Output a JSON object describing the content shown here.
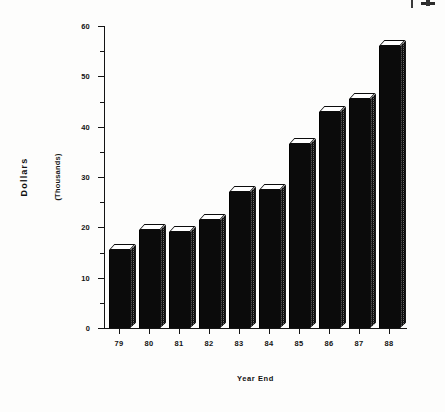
{
  "chart_data": {
    "type": "bar",
    "title": "",
    "subtitle": "",
    "xlabel": "Year End",
    "ylabel": "Dollars",
    "ylabel_units": "(Thousands)",
    "categories": [
      "79",
      "80",
      "81",
      "82",
      "83",
      "84",
      "85",
      "86",
      "87",
      "88"
    ],
    "values": [
      15.5,
      19.5,
      19.0,
      21.5,
      27.0,
      27.5,
      36.5,
      43.0,
      45.5,
      56.0
    ],
    "ylim": [
      0,
      60
    ],
    "y_major_ticks": [
      0,
      10,
      20,
      30,
      40,
      50,
      60
    ],
    "y_major_tick_labels": [
      "0",
      "10",
      "20",
      "30",
      "40",
      "50",
      "60"
    ],
    "y_minor_ticks": [
      5,
      15,
      25,
      35,
      45,
      55
    ],
    "grid": false,
    "legend": false,
    "legend_position": "none",
    "bar_style": "3d-block",
    "colors": {
      "bar_front": "#0b0b0b",
      "bar_top": "#ffffff",
      "bar_side": "#7d7d7d",
      "axis": "#141414",
      "text": "#111111",
      "background": "#fdfdfc"
    }
  },
  "axes": {
    "y_title": "Dollars",
    "y_units": "(Thousands)",
    "x_title": "Year End"
  },
  "artifact": {
    "name": "scan-edge-mark"
  }
}
